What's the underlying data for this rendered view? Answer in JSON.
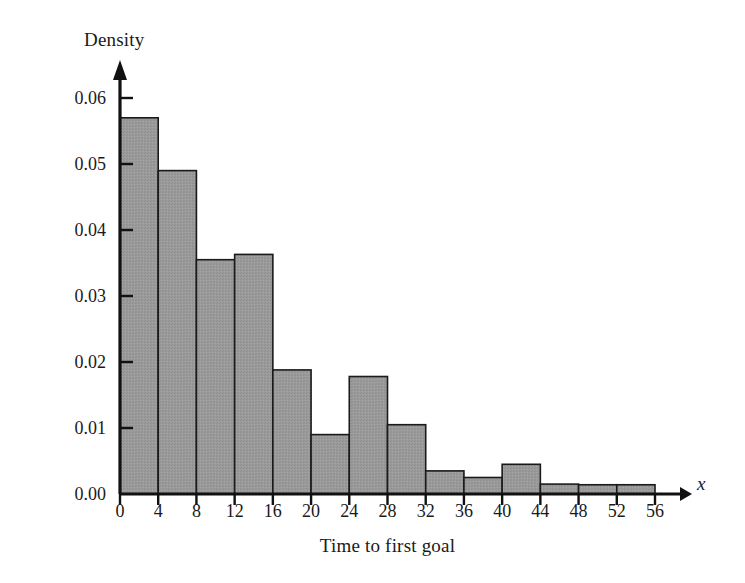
{
  "chart_data": {
    "type": "bar",
    "title": "",
    "xlabel": "Time to first goal",
    "ylabel": "Density",
    "x_axis_variable": "x",
    "bin_width": 4,
    "categories": [
      "0-4",
      "4-8",
      "8-12",
      "12-16",
      "16-20",
      "20-24",
      "24-28",
      "28-32",
      "32-36",
      "36-40",
      "40-44",
      "44-48",
      "48-52",
      "52-56"
    ],
    "bin_starts": [
      0,
      4,
      8,
      12,
      16,
      20,
      24,
      28,
      32,
      36,
      40,
      44,
      48,
      52
    ],
    "values": [
      0.057,
      0.049,
      0.0355,
      0.0363,
      0.0188,
      0.009,
      0.0178,
      0.0105,
      0.0035,
      0.0025,
      0.0045,
      0.0015,
      0.0014,
      0.0014
    ],
    "xlim": [
      0,
      56
    ],
    "ylim": [
      0.0,
      0.06
    ],
    "xticks": [
      0,
      4,
      8,
      12,
      16,
      20,
      24,
      28,
      32,
      36,
      40,
      44,
      48,
      52,
      56
    ],
    "xtick_labels": [
      "0",
      "4",
      "8",
      "12",
      "16",
      "20",
      "24",
      "28",
      "32",
      "36",
      "40",
      "44",
      "48",
      "52",
      "56"
    ],
    "yticks": [
      0.0,
      0.01,
      0.02,
      0.03,
      0.04,
      0.05,
      0.06
    ],
    "ytick_labels": [
      "0.00",
      "0.01",
      "0.02",
      "0.03",
      "0.04",
      "0.05",
      "0.06"
    ],
    "grid": false,
    "legend": false,
    "bar_fill_color": "#9a9a9a",
    "bar_edge_color": "#1a1a1a",
    "axis_color": "#111111"
  }
}
